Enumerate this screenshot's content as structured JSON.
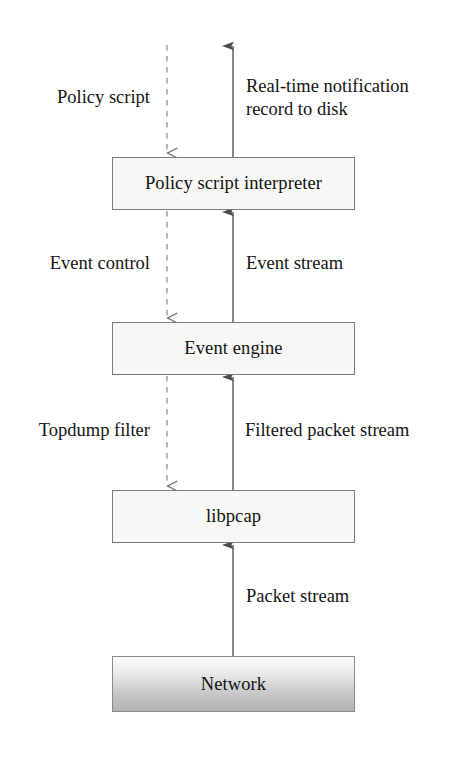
{
  "diagram": {
    "colors": {
      "box_fill": "#f7f7f5",
      "box_border": "#7d7d7d",
      "line": "#4a4a4a",
      "text": "#121212",
      "network_gradient_top": "#fcfcfc",
      "network_gradient_bottom": "#b4b4b4",
      "background": "#ffffff"
    },
    "nodes": [
      {
        "id": "policy-script-interpreter",
        "label": "Policy script interpreter",
        "x": 112,
        "y": 157,
        "width": 243,
        "height": 53,
        "style": "plain"
      },
      {
        "id": "event-engine",
        "label": "Event engine",
        "x": 112,
        "y": 322,
        "width": 243,
        "height": 53,
        "style": "plain"
      },
      {
        "id": "libpcap",
        "label": "libpcap",
        "x": 112,
        "y": 490,
        "width": 243,
        "height": 53,
        "style": "plain"
      },
      {
        "id": "network",
        "label": "Network",
        "x": 112,
        "y": 656,
        "width": 243,
        "height": 56,
        "style": "gradient"
      }
    ],
    "edges": [
      {
        "id": "policy-script-input",
        "label": "Policy script",
        "direction": "down",
        "line_style": "dashed",
        "arrowhead": "open-chevron",
        "x": 167,
        "from_y": 45,
        "to_y": 157
      },
      {
        "id": "real-time-notification-output",
        "label": "Real-time notification\nrecord to disk",
        "direction": "up",
        "line_style": "solid",
        "arrowhead": "filled-triangle",
        "x": 233,
        "from_y": 157,
        "to_y": 45
      },
      {
        "id": "event-control",
        "label": "Event control",
        "direction": "down",
        "line_style": "dashed",
        "arrowhead": "open-chevron",
        "x": 167,
        "from_y": 210,
        "to_y": 322
      },
      {
        "id": "event-stream",
        "label": "Event stream",
        "direction": "up",
        "line_style": "solid",
        "arrowhead": "filled-triangle",
        "x": 233,
        "from_y": 322,
        "to_y": 210
      },
      {
        "id": "topdump-filter",
        "label": "Topdump filter",
        "direction": "down",
        "line_style": "dashed",
        "arrowhead": "open-chevron",
        "x": 167,
        "from_y": 375,
        "to_y": 490
      },
      {
        "id": "filtered-packet-stream",
        "label": "Filtered packet stream",
        "direction": "up",
        "line_style": "solid",
        "arrowhead": "filled-triangle",
        "x": 233,
        "from_y": 490,
        "to_y": 375
      },
      {
        "id": "packet-stream",
        "label": "Packet stream",
        "direction": "up",
        "line_style": "solid",
        "arrowhead": "filled-triangle",
        "x": 233,
        "from_y": 656,
        "to_y": 543
      }
    ],
    "labels": {
      "policy_script": "Policy script",
      "real_time_notification": "Real-time notification\nrecord to disk",
      "event_control": "Event control",
      "event_stream": "Event stream",
      "topdump_filter": "Topdump filter",
      "filtered_packet_stream": "Filtered packet stream",
      "packet_stream": "Packet stream"
    }
  }
}
